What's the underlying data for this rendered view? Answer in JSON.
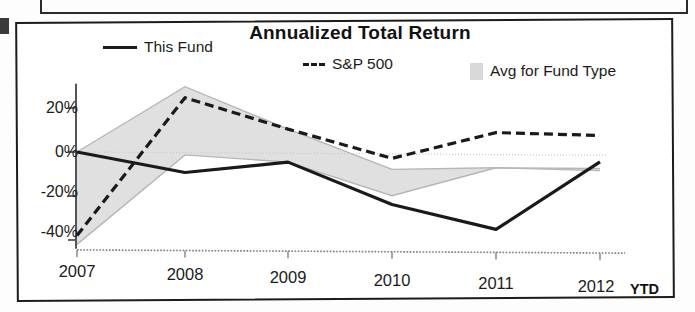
{
  "chart": {
    "title": "Annualized Total Return",
    "ytd_note": "YTD"
  },
  "legend": [
    {
      "key": "this_fund",
      "label": "This Fund",
      "style": "solid-line",
      "icon": "solid-line-swatch"
    },
    {
      "key": "sp500",
      "label": "S&P 500",
      "style": "dashed-line",
      "icon": "dashed-line-swatch"
    },
    {
      "key": "avg_band",
      "label": "Avg for Fund Type",
      "style": "band",
      "icon": "gray-band-swatch"
    }
  ],
  "axes": {
    "y_ticks": [
      "20%",
      "0%",
      "-20%",
      "-40%"
    ],
    "x_ticks": [
      "2007",
      "2008",
      "2009",
      "2010",
      "2011",
      "2012"
    ]
  },
  "colors": {
    "line": "#1a1a1a",
    "band_fill": "#dedede",
    "band_edge": "#b6b6b6",
    "axis": "#555555",
    "frame": "#1c1c1c"
  },
  "chart_data": {
    "type": "line",
    "title": "Annualized Total Return",
    "xlabel": "",
    "ylabel": "",
    "categories": [
      "2007",
      "2008",
      "2009",
      "2010",
      "2011",
      "2012"
    ],
    "x_tick_suffix_last": "YTD",
    "ylim": [
      -45,
      32
    ],
    "y_ticks": [
      20,
      0,
      -20,
      -40
    ],
    "y_tick_labels": [
      "20%",
      "0%",
      "-20%",
      "-40%"
    ],
    "grid": false,
    "legend_position": "top",
    "units": "percent",
    "series": [
      {
        "name": "This Fund",
        "style": "solid",
        "values": [
          0,
          -9,
          -4,
          -23,
          -34,
          -3
        ]
      },
      {
        "name": "S&P 500",
        "style": "dashed",
        "values": [
          -38,
          25,
          11,
          -2,
          10,
          9
        ]
      }
    ],
    "band": {
      "name": "Avg for Fund Type",
      "style": "shaded",
      "upper": [
        0,
        30,
        11,
        -7,
        -6,
        -6
      ],
      "lower": [
        -42,
        -1,
        -4,
        -19,
        -6,
        -7
      ]
    }
  }
}
